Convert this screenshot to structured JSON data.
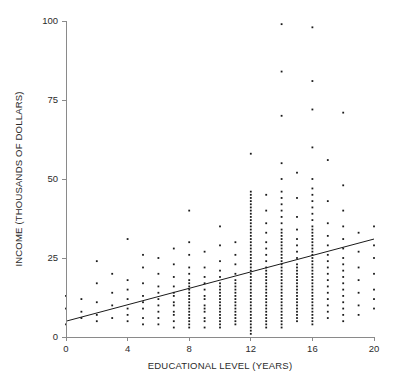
{
  "chart_data": {
    "type": "scatter",
    "title": "",
    "xlabel": "EDUCATIONAL LEVEL (YEARS)",
    "ylabel": "INCOME (THOUSANDS OF DOLLARS)",
    "xlim": [
      0,
      20
    ],
    "ylim": [
      0,
      100
    ],
    "xticks": [
      0,
      4,
      8,
      12,
      16,
      20
    ],
    "yticks": [
      0,
      25,
      50,
      75,
      100
    ],
    "xtick_labels": [
      "0",
      "4",
      "8",
      "12",
      "16",
      "20"
    ],
    "ytick_labels": [
      "0",
      "25",
      "50",
      "75",
      "100"
    ],
    "grid": false,
    "legend": false,
    "marker_color": "#1a1a1a",
    "axis_color": "#8a8a8a",
    "trendline": {
      "type": "linear",
      "color": "#1a1a1a",
      "x_start": 0,
      "y_start": 5,
      "x_end": 20,
      "y_end": 31,
      "slope": 1.3,
      "intercept": 5
    },
    "points": [
      [
        0,
        13
      ],
      [
        0,
        9
      ],
      [
        0,
        4
      ],
      [
        1,
        12
      ],
      [
        1,
        8
      ],
      [
        1,
        6
      ],
      [
        2,
        24
      ],
      [
        2,
        17
      ],
      [
        2,
        11
      ],
      [
        2,
        7
      ],
      [
        2,
        5
      ],
      [
        3,
        20
      ],
      [
        3,
        14
      ],
      [
        3,
        10
      ],
      [
        3,
        6
      ],
      [
        4,
        31
      ],
      [
        4,
        18
      ],
      [
        4,
        15
      ],
      [
        4,
        12
      ],
      [
        4,
        9
      ],
      [
        4,
        7
      ],
      [
        4,
        5
      ],
      [
        5,
        26
      ],
      [
        5,
        22
      ],
      [
        5,
        17
      ],
      [
        5,
        13
      ],
      [
        5,
        11
      ],
      [
        5,
        9
      ],
      [
        5,
        6
      ],
      [
        5,
        4
      ],
      [
        6,
        25
      ],
      [
        6,
        20
      ],
      [
        6,
        16
      ],
      [
        6,
        14
      ],
      [
        6,
        12
      ],
      [
        6,
        10
      ],
      [
        6,
        8
      ],
      [
        6,
        6
      ],
      [
        6,
        4
      ],
      [
        7,
        28
      ],
      [
        7,
        23
      ],
      [
        7,
        19
      ],
      [
        7,
        16
      ],
      [
        7,
        14
      ],
      [
        7,
        13
      ],
      [
        7,
        11
      ],
      [
        7,
        10
      ],
      [
        7,
        8
      ],
      [
        7,
        7
      ],
      [
        7,
        5
      ],
      [
        7,
        3
      ],
      [
        8,
        40
      ],
      [
        8,
        30
      ],
      [
        8,
        26
      ],
      [
        8,
        22
      ],
      [
        8,
        20
      ],
      [
        8,
        18
      ],
      [
        8,
        17
      ],
      [
        8,
        16
      ],
      [
        8,
        15
      ],
      [
        8,
        14
      ],
      [
        8,
        13
      ],
      [
        8,
        12
      ],
      [
        8,
        11
      ],
      [
        8,
        10
      ],
      [
        8,
        9
      ],
      [
        8,
        8
      ],
      [
        8,
        7
      ],
      [
        8,
        6
      ],
      [
        8,
        5
      ],
      [
        8,
        4
      ],
      [
        8,
        3
      ],
      [
        9,
        27
      ],
      [
        9,
        22
      ],
      [
        9,
        19
      ],
      [
        9,
        17
      ],
      [
        9,
        15
      ],
      [
        9,
        13
      ],
      [
        9,
        12
      ],
      [
        9,
        10
      ],
      [
        9,
        9
      ],
      [
        9,
        8
      ],
      [
        9,
        6
      ],
      [
        9,
        5
      ],
      [
        9,
        3
      ],
      [
        10,
        35
      ],
      [
        10,
        29
      ],
      [
        10,
        24
      ],
      [
        10,
        21
      ],
      [
        10,
        19
      ],
      [
        10,
        17
      ],
      [
        10,
        16
      ],
      [
        10,
        15
      ],
      [
        10,
        14
      ],
      [
        10,
        13
      ],
      [
        10,
        12
      ],
      [
        10,
        11
      ],
      [
        10,
        10
      ],
      [
        10,
        9
      ],
      [
        10,
        8
      ],
      [
        10,
        7
      ],
      [
        10,
        6
      ],
      [
        10,
        5
      ],
      [
        10,
        4
      ],
      [
        10,
        3
      ],
      [
        11,
        30
      ],
      [
        11,
        26
      ],
      [
        11,
        23
      ],
      [
        11,
        20
      ],
      [
        11,
        18
      ],
      [
        11,
        17
      ],
      [
        11,
        16
      ],
      [
        11,
        15
      ],
      [
        11,
        14
      ],
      [
        11,
        13
      ],
      [
        11,
        12
      ],
      [
        11,
        11
      ],
      [
        11,
        10
      ],
      [
        11,
        9
      ],
      [
        11,
        8
      ],
      [
        11,
        7
      ],
      [
        11,
        6
      ],
      [
        11,
        5
      ],
      [
        11,
        4
      ],
      [
        12,
        58
      ],
      [
        12,
        46
      ],
      [
        12,
        45
      ],
      [
        12,
        44
      ],
      [
        12,
        43
      ],
      [
        12,
        42
      ],
      [
        12,
        41
      ],
      [
        12,
        40
      ],
      [
        12,
        39
      ],
      [
        12,
        38
      ],
      [
        12,
        37
      ],
      [
        12,
        36
      ],
      [
        12,
        35
      ],
      [
        12,
        34
      ],
      [
        12,
        33
      ],
      [
        12,
        32
      ],
      [
        12,
        31
      ],
      [
        12,
        30
      ],
      [
        12,
        29
      ],
      [
        12,
        28
      ],
      [
        12,
        27
      ],
      [
        12,
        26
      ],
      [
        12,
        25
      ],
      [
        12,
        24
      ],
      [
        12,
        23
      ],
      [
        12,
        22
      ],
      [
        12,
        21
      ],
      [
        12,
        20
      ],
      [
        12,
        19
      ],
      [
        12,
        18
      ],
      [
        12,
        17
      ],
      [
        12,
        16
      ],
      [
        12,
        15
      ],
      [
        12,
        14
      ],
      [
        12,
        13
      ],
      [
        12,
        12
      ],
      [
        12,
        11
      ],
      [
        12,
        10
      ],
      [
        12,
        9
      ],
      [
        12,
        8
      ],
      [
        12,
        7
      ],
      [
        12,
        6
      ],
      [
        12,
        5
      ],
      [
        12,
        4
      ],
      [
        12,
        3
      ],
      [
        12,
        2
      ],
      [
        12,
        1
      ],
      [
        13,
        45
      ],
      [
        13,
        40
      ],
      [
        13,
        36
      ],
      [
        13,
        33
      ],
      [
        13,
        30
      ],
      [
        13,
        28
      ],
      [
        13,
        26
      ],
      [
        13,
        24
      ],
      [
        13,
        22
      ],
      [
        13,
        21
      ],
      [
        13,
        20
      ],
      [
        13,
        19
      ],
      [
        13,
        18
      ],
      [
        13,
        17
      ],
      [
        13,
        16
      ],
      [
        13,
        15
      ],
      [
        13,
        14
      ],
      [
        13,
        13
      ],
      [
        13,
        12
      ],
      [
        13,
        11
      ],
      [
        13,
        10
      ],
      [
        13,
        9
      ],
      [
        13,
        8
      ],
      [
        13,
        7
      ],
      [
        13,
        6
      ],
      [
        13,
        5
      ],
      [
        13,
        4
      ],
      [
        13,
        3
      ],
      [
        14,
        99
      ],
      [
        14,
        84
      ],
      [
        14,
        70
      ],
      [
        14,
        55
      ],
      [
        14,
        50
      ],
      [
        14,
        46
      ],
      [
        14,
        44
      ],
      [
        14,
        42
      ],
      [
        14,
        40
      ],
      [
        14,
        38
      ],
      [
        14,
        36
      ],
      [
        14,
        34
      ],
      [
        14,
        33
      ],
      [
        14,
        32
      ],
      [
        14,
        31
      ],
      [
        14,
        30
      ],
      [
        14,
        29
      ],
      [
        14,
        28
      ],
      [
        14,
        27
      ],
      [
        14,
        26
      ],
      [
        14,
        25
      ],
      [
        14,
        24
      ],
      [
        14,
        23
      ],
      [
        14,
        22
      ],
      [
        14,
        21
      ],
      [
        14,
        20
      ],
      [
        14,
        19
      ],
      [
        14,
        18
      ],
      [
        14,
        17
      ],
      [
        14,
        16
      ],
      [
        14,
        15
      ],
      [
        14,
        14
      ],
      [
        14,
        13
      ],
      [
        14,
        12
      ],
      [
        14,
        11
      ],
      [
        14,
        10
      ],
      [
        14,
        9
      ],
      [
        14,
        8
      ],
      [
        14,
        7
      ],
      [
        14,
        6
      ],
      [
        14,
        5
      ],
      [
        14,
        4
      ],
      [
        14,
        3
      ],
      [
        15,
        52
      ],
      [
        15,
        44
      ],
      [
        15,
        38
      ],
      [
        15,
        34
      ],
      [
        15,
        31
      ],
      [
        15,
        29
      ],
      [
        15,
        27
      ],
      [
        15,
        25
      ],
      [
        15,
        23
      ],
      [
        15,
        22
      ],
      [
        15,
        21
      ],
      [
        15,
        20
      ],
      [
        15,
        19
      ],
      [
        15,
        18
      ],
      [
        15,
        17
      ],
      [
        15,
        16
      ],
      [
        15,
        15
      ],
      [
        15,
        14
      ],
      [
        15,
        13
      ],
      [
        15,
        12
      ],
      [
        15,
        11
      ],
      [
        15,
        10
      ],
      [
        15,
        9
      ],
      [
        15,
        8
      ],
      [
        15,
        7
      ],
      [
        15,
        6
      ],
      [
        15,
        5
      ],
      [
        16,
        98
      ],
      [
        16,
        81
      ],
      [
        16,
        72
      ],
      [
        16,
        60
      ],
      [
        16,
        50
      ],
      [
        16,
        47
      ],
      [
        16,
        45
      ],
      [
        16,
        43
      ],
      [
        16,
        41
      ],
      [
        16,
        39
      ],
      [
        16,
        37
      ],
      [
        16,
        35
      ],
      [
        16,
        34
      ],
      [
        16,
        33
      ],
      [
        16,
        32
      ],
      [
        16,
        31
      ],
      [
        16,
        30
      ],
      [
        16,
        29
      ],
      [
        16,
        28
      ],
      [
        16,
        27
      ],
      [
        16,
        26
      ],
      [
        16,
        25
      ],
      [
        16,
        24
      ],
      [
        16,
        23
      ],
      [
        16,
        22
      ],
      [
        16,
        21
      ],
      [
        16,
        20
      ],
      [
        16,
        19
      ],
      [
        16,
        18
      ],
      [
        16,
        17
      ],
      [
        16,
        16
      ],
      [
        16,
        15
      ],
      [
        16,
        14
      ],
      [
        16,
        13
      ],
      [
        16,
        12
      ],
      [
        16,
        11
      ],
      [
        16,
        10
      ],
      [
        16,
        9
      ],
      [
        16,
        8
      ],
      [
        16,
        7
      ],
      [
        16,
        6
      ],
      [
        16,
        5
      ],
      [
        16,
        4
      ],
      [
        17,
        56
      ],
      [
        17,
        43
      ],
      [
        17,
        36
      ],
      [
        17,
        32
      ],
      [
        17,
        29
      ],
      [
        17,
        26
      ],
      [
        17,
        24
      ],
      [
        17,
        22
      ],
      [
        17,
        20
      ],
      [
        17,
        18
      ],
      [
        17,
        16
      ],
      [
        17,
        14
      ],
      [
        17,
        12
      ],
      [
        17,
        10
      ],
      [
        17,
        8
      ],
      [
        17,
        6
      ],
      [
        18,
        71
      ],
      [
        18,
        48
      ],
      [
        18,
        40
      ],
      [
        18,
        35
      ],
      [
        18,
        31
      ],
      [
        18,
        28
      ],
      [
        18,
        25
      ],
      [
        18,
        23
      ],
      [
        18,
        21
      ],
      [
        18,
        19
      ],
      [
        18,
        17
      ],
      [
        18,
        15
      ],
      [
        18,
        13
      ],
      [
        18,
        11
      ],
      [
        18,
        9
      ],
      [
        18,
        7
      ],
      [
        18,
        5
      ],
      [
        19,
        33
      ],
      [
        19,
        27
      ],
      [
        19,
        22
      ],
      [
        19,
        18
      ],
      [
        19,
        14
      ],
      [
        19,
        10
      ],
      [
        19,
        7
      ],
      [
        20,
        35
      ],
      [
        20,
        29
      ],
      [
        20,
        25
      ],
      [
        20,
        20
      ],
      [
        20,
        15
      ],
      [
        20,
        12
      ],
      [
        20,
        9
      ]
    ]
  }
}
